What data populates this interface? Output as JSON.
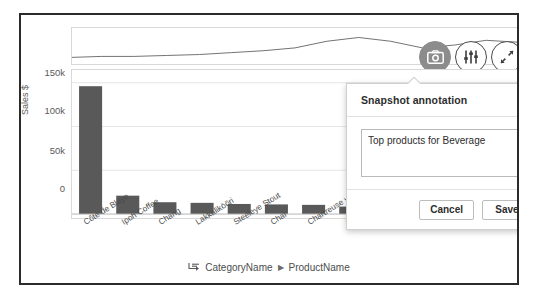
{
  "chart_data": {
    "type": "bar",
    "title": "",
    "xlabel": "CategoryName > ProductName",
    "ylabel": "Sales $",
    "ylim": [
      0,
      160000
    ],
    "yticks": [
      0,
      50000,
      100000,
      150000
    ],
    "ytick_labels": [
      "0",
      "50k",
      "100k",
      "150k"
    ],
    "grid": true,
    "legend": "none",
    "bar_color": "#595959",
    "categories": [
      "Côte de Blaye",
      "Ipoh Coffee",
      "Chang",
      "Lakkalikööri",
      "Steeleye Stout",
      "Chai",
      "Chartreuse verte",
      "Outback Lager",
      "Rhönbräu Klosterbier",
      "Sasquatch Ale",
      "Guaraná Fantástica",
      "Laughing Lumberjack"
    ],
    "values": [
      146000,
      21000,
      13500,
      12800,
      11500,
      11000,
      10500,
      8500,
      7800,
      6500,
      5200,
      4200
    ]
  },
  "overview_chart": {
    "type": "line",
    "name": "sales-trend-sparkline",
    "points": [
      0,
      3,
      4,
      5,
      7,
      9,
      12,
      18,
      30,
      40,
      33,
      22,
      26,
      34,
      30,
      28
    ]
  },
  "toolbar": {
    "snapshot_icon": "camera-icon",
    "snapshot_label": "Take snapshot",
    "filter_icon": "sliders-icon",
    "filter_label": "Selections",
    "fullscreen_icon": "expand-icon",
    "fullscreen_label": "Fullscreen"
  },
  "chart_header": {
    "category_label": "Category"
  },
  "axis": {
    "y_title": "Sales $",
    "y_ticks": [
      "150k",
      "100k",
      "50k",
      "0"
    ]
  },
  "breadcrumb": {
    "drill_icon": "drill-down-icon",
    "level_1": "CategoryName",
    "separator": "▶",
    "level_2": "ProductName"
  },
  "popup": {
    "title": "Snapshot annotation",
    "annotation_value": "Top products for Beverage",
    "annotation_placeholder": "Enter annotation",
    "cancel_label": "Cancel",
    "save_label": "Save"
  },
  "colors": {
    "bar": "#595959",
    "frame": "#2b2b2b",
    "grid": "#e6e6e6",
    "active_icon_bg": "#8c8c8c"
  }
}
